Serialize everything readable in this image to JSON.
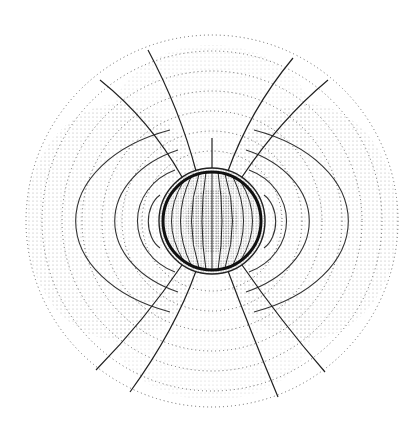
{
  "figure": {
    "background": "#ffffff",
    "ink": "#222222",
    "dot_ink": "#555555",
    "sphere": {
      "cx": 212,
      "cy": 221,
      "r": 53
    },
    "inner_sphere_ring": {
      "r": 49
    },
    "side_arcs": {
      "radii_x": [
        20,
        62,
        110,
        160
      ],
      "radii_y": [
        35,
        70,
        100,
        130
      ]
    },
    "field_lines_top": [
      {
        "x1": 212,
        "y1": 168,
        "x2": 212,
        "y2": 138
      },
      {
        "x1": 196,
        "y1": 171,
        "x2": 148,
        "y2": 50
      },
      {
        "x1": 228,
        "y1": 171,
        "x2": 293,
        "y2": 58
      },
      {
        "x1": 182,
        "y1": 177,
        "x2": 100,
        "y2": 80
      },
      {
        "x1": 242,
        "y1": 177,
        "x2": 328,
        "y2": 80
      }
    ],
    "field_lines_bottom": [
      {
        "x1": 196,
        "y1": 271,
        "x2": 130,
        "y2": 392
      },
      {
        "x1": 228,
        "y1": 271,
        "x2": 278,
        "y2": 397
      },
      {
        "x1": 182,
        "y1": 265,
        "x2": 96,
        "y2": 370
      },
      {
        "x1": 242,
        "y1": 265,
        "x2": 325,
        "y2": 372
      }
    ]
  }
}
